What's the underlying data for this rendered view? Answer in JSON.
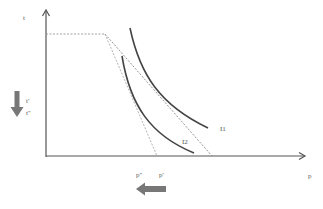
{
  "diagram": {
    "axes": {
      "y_label": "t",
      "x_label": "p",
      "color": "#555555"
    },
    "y_ticks": [
      {
        "label": "t'"
      },
      {
        "label": "t''"
      }
    ],
    "x_ticks": [
      {
        "label": "p''"
      },
      {
        "label": "p'"
      }
    ],
    "curves": [
      {
        "label": "I1"
      },
      {
        "label": "I2"
      }
    ],
    "arrows": {
      "down_arrow": "arrow-down-icon",
      "left_arrow": "arrow-left-icon",
      "color": "#777777"
    },
    "dashed_color": "#999999",
    "curve_color": "#444444"
  }
}
